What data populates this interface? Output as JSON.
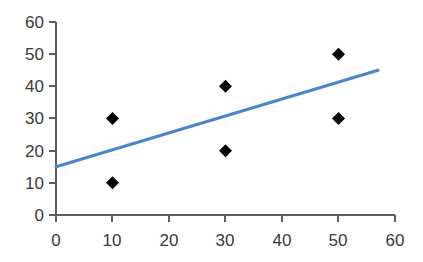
{
  "chart_data": {
    "type": "scatter",
    "title": "",
    "subtitle": "",
    "xlabel": "",
    "ylabel": "",
    "xlim": [
      0,
      60
    ],
    "ylim": [
      0,
      60
    ],
    "xticks": [
      0,
      10,
      20,
      30,
      40,
      50,
      60
    ],
    "yticks": [
      0,
      10,
      20,
      30,
      40,
      50,
      60
    ],
    "xtick_labels": [
      "0",
      "10",
      "20",
      "30",
      "40",
      "50",
      "60"
    ],
    "ytick_labels": [
      "0",
      "10",
      "20",
      "30",
      "40",
      "50",
      "60"
    ],
    "grid": false,
    "legend": false,
    "legend_position": "none",
    "series": [
      {
        "name": "data-points",
        "type": "scatter",
        "marker": "diamond",
        "color": "#000000",
        "points": [
          {
            "x": 10,
            "y": 30
          },
          {
            "x": 10,
            "y": 10
          },
          {
            "x": 30,
            "y": 40
          },
          {
            "x": 30,
            "y": 20
          },
          {
            "x": 50,
            "y": 50
          },
          {
            "x": 50,
            "y": 30
          }
        ]
      },
      {
        "name": "trend-line",
        "type": "line",
        "color": "#4a86c8",
        "points": [
          {
            "x": 0,
            "y": 15
          },
          {
            "x": 57,
            "y": 45
          }
        ]
      }
    ]
  },
  "axes": {
    "x_axis_name": "x-axis",
    "y_axis_name": "y-axis",
    "axis_color": "#5e5e5e",
    "tick_color": "#5e5e5e",
    "label_color": "#3a3a3a"
  },
  "colors": {
    "background": "#ffffff",
    "marker": "#000000",
    "trend": "#4a86c8"
  }
}
